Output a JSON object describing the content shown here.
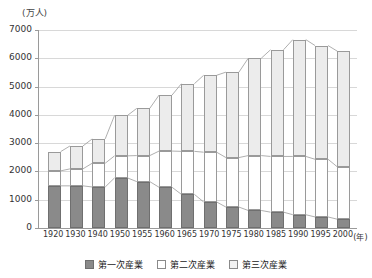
{
  "chart_data": {
    "type": "bar",
    "title": "",
    "subtitle": "",
    "stacked": true,
    "unit_label": "(万人)",
    "xlabel": "(年)",
    "ylabel": "",
    "ylim": [
      0,
      7000
    ],
    "ytick_values": [
      0,
      1000,
      2000,
      3000,
      4000,
      5000,
      6000,
      7000
    ],
    "ytick_labels": [
      "0",
      "1000",
      "2000",
      "3000",
      "4000",
      "5000",
      "6000",
      "7000"
    ],
    "grid": true,
    "legend_position": "bottom",
    "categories": [
      "1920",
      "1930",
      "1940",
      "1950",
      "1955",
      "1960",
      "1965",
      "1970",
      "1975",
      "1980",
      "1985",
      "1990",
      "1995",
      "2000"
    ],
    "series": [
      {
        "name": "第一次産業",
        "color": "#8a8a8a",
        "values": [
          1490,
          1490,
          1450,
          1770,
          1640,
          1440,
          1190,
          920,
          740,
          620,
          560,
          470,
          390,
          310
        ]
      },
      {
        "name": "第二次産業",
        "color": "#ffffff",
        "values": [
          530,
          600,
          840,
          780,
          920,
          1280,
          1520,
          1760,
          1750,
          1940,
          1970,
          2060,
          2040,
          1850
        ]
      },
      {
        "name": "第三次産業",
        "color": "#ececec",
        "values": [
          680,
          810,
          860,
          1430,
          1670,
          1980,
          2390,
          2720,
          3020,
          3440,
          3770,
          4130,
          4020,
          4090
        ]
      }
    ],
    "totals": [
      2700,
      2900,
      3150,
      3980,
      4230,
      4700,
      5100,
      5400,
      5510,
      6000,
      6300,
      6660,
      6450,
      6250
    ]
  },
  "legend": {
    "items": [
      {
        "label": "第一次産業",
        "swatch": "primary"
      },
      {
        "label": "第二次産業",
        "swatch": "secondary"
      },
      {
        "label": "第三次産業",
        "swatch": "tertiary"
      }
    ]
  }
}
